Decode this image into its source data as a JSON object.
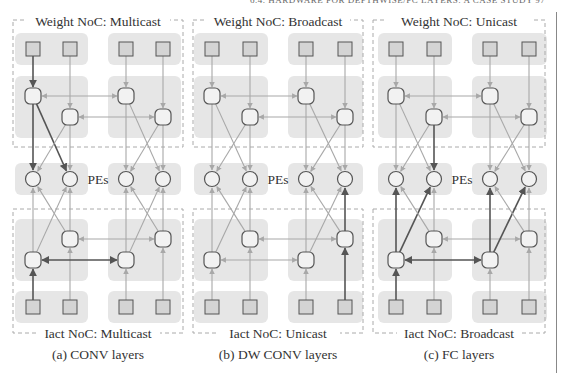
{
  "running_header": "6.4. HARDWARE FOR DEPTHWISE/FC LAYERS: A CASE STUDY   97",
  "colors": {
    "group_bg": "#e6e6e6",
    "dashed_box": "#aaaaaa",
    "arrow_light": "#a8a8a8",
    "arrow_dark": "#555555",
    "node_stroke": "#555555",
    "node_fill": "#f2f2f2",
    "square_fill": "#d4d4d4"
  },
  "panels": [
    {
      "id": "a",
      "x_cols": [
        33,
        70,
        126,
        163
      ],
      "box": [
        13,
        183
      ],
      "weight_label": "Weight NoC: Multicast",
      "iact_label": "Iact NoC: Multicast",
      "caption": "(a) CONV layers",
      "pes_label": "PEs",
      "dark_paths": [
        "w0-r",
        "w0-pe0",
        "w0-pe1",
        "i0-r",
        "i0-h"
      ]
    },
    {
      "id": "b",
      "x_cols": [
        212,
        250,
        306,
        345
      ],
      "box": [
        193,
        363
      ],
      "weight_label": "Weight NoC: Broadcast",
      "iact_label": "Iact NoC: Unicast",
      "caption": "(b) DW CONV layers",
      "pes_label": "PEs",
      "dark_paths": [
        "i3-r",
        "i3-pe3"
      ]
    },
    {
      "id": "c",
      "x_cols": [
        396,
        434,
        490,
        529
      ],
      "box": [
        373,
        545
      ],
      "weight_label": "Weight NoC: Unicast",
      "iact_label": "Iact NoC: Broadcast",
      "caption": "(c) FC layers",
      "pes_label": "PEs",
      "dark_paths": [
        "w1-pe1",
        "i0-r",
        "i0-h",
        "i0-pe0",
        "i0-pe1",
        "i2-pe2",
        "i2-pe3"
      ]
    }
  ],
  "rows_y": {
    "top_square": 49,
    "weight_router_a": 96,
    "weight_router_b": 117,
    "pe": 179,
    "iact_router_b": 239,
    "iact_router_a": 260,
    "bottom_square": 307,
    "weight_label": 26,
    "iact_label": 338,
    "caption": 359
  }
}
